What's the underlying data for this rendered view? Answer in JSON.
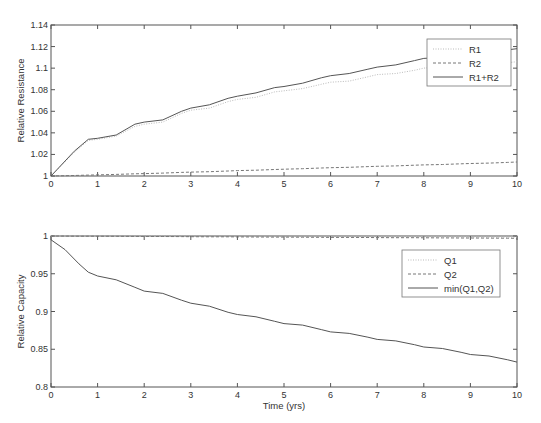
{
  "chart_data": [
    {
      "type": "line",
      "title": "",
      "xlabel": "",
      "ylabel": "Relative Resistance",
      "xlim": [
        0,
        10
      ],
      "ylim": [
        1,
        1.14
      ],
      "xticks": [
        "0",
        "1",
        "2",
        "3",
        "4",
        "5",
        "6",
        "7",
        "8",
        "9",
        "10"
      ],
      "yticks": [
        "1",
        "1.02",
        "1.04",
        "1.06",
        "1.08",
        "1.1",
        "1.12",
        "1.14"
      ],
      "grid": false,
      "legend_position": "upper right",
      "x": [
        0,
        0.5,
        0.8,
        1.0,
        1.4,
        1.8,
        2.0,
        2.4,
        2.8,
        3.0,
        3.4,
        3.8,
        4.0,
        4.4,
        4.8,
        5.0,
        5.4,
        5.8,
        6.0,
        6.4,
        6.8,
        7.0,
        7.4,
        7.8,
        8.0,
        8.4,
        8.8,
        9.0,
        9.4,
        9.8,
        10.0
      ],
      "series": [
        {
          "name": "R1",
          "style": "dotted",
          "color": "#bbbbbb",
          "values": [
            1.0,
            1.022,
            1.033,
            1.034,
            1.037,
            1.046,
            1.048,
            1.05,
            1.058,
            1.061,
            1.063,
            1.069,
            1.071,
            1.073,
            1.078,
            1.079,
            1.081,
            1.085,
            1.087,
            1.088,
            1.092,
            1.094,
            1.095,
            1.098,
            1.1,
            1.101,
            1.103,
            1.104,
            1.104,
            1.105,
            1.106
          ]
        },
        {
          "name": "R2",
          "style": "dashed",
          "color": "#777777",
          "values": [
            1.0,
            1.0005,
            1.0008,
            1.001,
            1.0015,
            1.002,
            1.0022,
            1.0027,
            1.0033,
            1.0036,
            1.004,
            1.0046,
            1.005,
            1.0054,
            1.006,
            1.0063,
            1.0068,
            1.0074,
            1.0077,
            1.0081,
            1.0087,
            1.009,
            1.0094,
            1.01,
            1.0103,
            1.0107,
            1.0113,
            1.0116,
            1.012,
            1.0126,
            1.013
          ]
        },
        {
          "name": "R1+R2",
          "style": "solid",
          "color": "#555555",
          "values": [
            1.0,
            1.023,
            1.034,
            1.035,
            1.038,
            1.048,
            1.05,
            1.052,
            1.06,
            1.063,
            1.066,
            1.072,
            1.074,
            1.077,
            1.082,
            1.083,
            1.086,
            1.091,
            1.093,
            1.095,
            1.099,
            1.101,
            1.103,
            1.107,
            1.109,
            1.11,
            1.114,
            1.115,
            1.116,
            1.117,
            1.118
          ]
        }
      ]
    },
    {
      "type": "line",
      "title": "",
      "xlabel": "Time (yrs)",
      "ylabel": "Relative Capacity",
      "xlim": [
        0,
        10
      ],
      "ylim": [
        0.8,
        1
      ],
      "xticks": [
        "0",
        "1",
        "2",
        "3",
        "4",
        "5",
        "6",
        "7",
        "8",
        "9",
        "10"
      ],
      "yticks": [
        "0.8",
        "0.85",
        "0.9",
        "0.95",
        "1"
      ],
      "grid": false,
      "legend_position": "upper right",
      "x": [
        0,
        0.3,
        0.6,
        0.8,
        1.0,
        1.4,
        1.8,
        2.0,
        2.4,
        2.8,
        3.0,
        3.4,
        3.8,
        4.0,
        4.4,
        4.8,
        5.0,
        5.4,
        5.8,
        6.0,
        6.4,
        6.8,
        7.0,
        7.4,
        7.8,
        8.0,
        8.4,
        8.8,
        9.0,
        9.4,
        9.8,
        10.0
      ],
      "series": [
        {
          "name": "Q1",
          "style": "dotted",
          "color": "#bbbbbb",
          "values": [
            1.0,
            1.0,
            0.9999,
            0.9999,
            0.9999,
            0.9998,
            0.9998,
            0.9997,
            0.9997,
            0.9996,
            0.9996,
            0.9995,
            0.9995,
            0.9994,
            0.9994,
            0.9993,
            0.9993,
            0.9992,
            0.9992,
            0.9991,
            0.9991,
            0.999,
            0.999,
            0.9989,
            0.9989,
            0.9988,
            0.9988,
            0.9987,
            0.9987,
            0.9986,
            0.9986,
            0.9985
          ]
        },
        {
          "name": "Q2",
          "style": "dashed",
          "color": "#777777",
          "values": [
            1.0,
            0.9999,
            0.9998,
            0.9998,
            0.9997,
            0.9996,
            0.9995,
            0.9994,
            0.9993,
            0.9992,
            0.9991,
            0.999,
            0.9989,
            0.9988,
            0.9987,
            0.9986,
            0.9985,
            0.9984,
            0.9983,
            0.9982,
            0.9981,
            0.998,
            0.9979,
            0.9978,
            0.9977,
            0.9976,
            0.9975,
            0.9974,
            0.9973,
            0.9972,
            0.9971,
            0.997
          ]
        },
        {
          "name": "min(Q1,Q2)",
          "style": "solid",
          "color": "#555555",
          "values": [
            0.995,
            0.982,
            0.963,
            0.952,
            0.947,
            0.942,
            0.932,
            0.927,
            0.924,
            0.915,
            0.911,
            0.907,
            0.899,
            0.896,
            0.893,
            0.887,
            0.884,
            0.882,
            0.876,
            0.873,
            0.871,
            0.866,
            0.863,
            0.861,
            0.856,
            0.853,
            0.851,
            0.846,
            0.843,
            0.841,
            0.836,
            0.833
          ]
        }
      ]
    }
  ]
}
